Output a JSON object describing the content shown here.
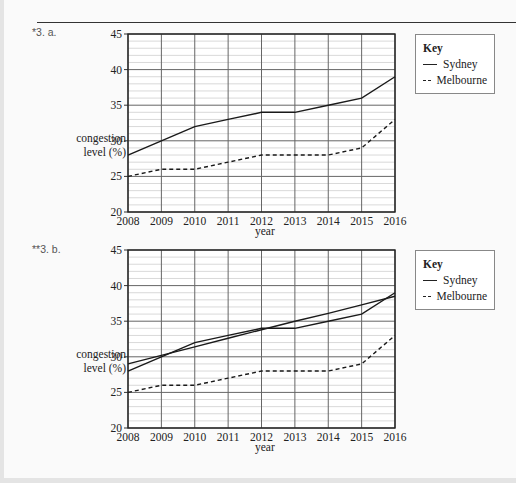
{
  "questions": [
    {
      "label": "*3. a."
    },
    {
      "label": "**3. b."
    }
  ],
  "legend": {
    "title": "Key",
    "items": [
      {
        "label": "Sydney",
        "style": "solid"
      },
      {
        "label": "Melbourne",
        "style": "dashed"
      }
    ]
  },
  "axis": {
    "ylabel_line1": "congestion",
    "ylabel_line2": "level (%)",
    "xlabel": "year"
  },
  "chart_data": [
    {
      "type": "line",
      "title": "*3. a.",
      "xlabel": "year",
      "ylabel": "congestion level (%)",
      "x": [
        2008,
        2009,
        2010,
        2011,
        2012,
        2013,
        2014,
        2015,
        2016
      ],
      "series": [
        {
          "name": "Sydney",
          "style": "solid",
          "values": [
            28,
            30,
            32,
            33,
            34,
            34,
            35,
            36,
            39
          ]
        },
        {
          "name": "Melbourne",
          "style": "dashed",
          "values": [
            25,
            26,
            26,
            27,
            28,
            28,
            28,
            29,
            33
          ]
        }
      ],
      "ylim": [
        20,
        45
      ],
      "yticks": [
        20,
        25,
        30,
        35,
        40,
        45
      ],
      "grid": true,
      "legend_position": "right"
    },
    {
      "type": "line",
      "title": "**3. b.",
      "xlabel": "year",
      "ylabel": "congestion level (%)",
      "x": [
        2008,
        2009,
        2010,
        2011,
        2012,
        2013,
        2014,
        2015,
        2016
      ],
      "series": [
        {
          "name": "Sydney",
          "style": "solid",
          "values": [
            28,
            30,
            32,
            33,
            34,
            34,
            35,
            36,
            39
          ]
        },
        {
          "name": "Melbourne",
          "style": "dashed",
          "values": [
            25,
            26,
            26,
            27,
            28,
            28,
            28,
            29,
            33
          ]
        },
        {
          "name": "Sydney trend line",
          "style": "solid",
          "values": [
            29,
            30.2,
            31.4,
            32.6,
            33.8,
            35,
            36.1,
            37.3,
            38.5
          ]
        }
      ],
      "ylim": [
        20,
        45
      ],
      "yticks": [
        20,
        25,
        30,
        35,
        40,
        45
      ],
      "grid": true,
      "legend_position": "right"
    }
  ]
}
